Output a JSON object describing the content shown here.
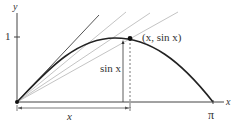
{
  "diagram": {
    "axes": {
      "x_label": "x",
      "y_label": "y",
      "y_tick_label": "1",
      "x_end_label": "π"
    },
    "point_label": "(x, sin x)",
    "height_label": "sin x",
    "base_label": "x",
    "colors": {
      "curve": "#222222",
      "tangent": "#555555",
      "secants": "#bbbbbb",
      "axes": "#444444"
    }
  }
}
